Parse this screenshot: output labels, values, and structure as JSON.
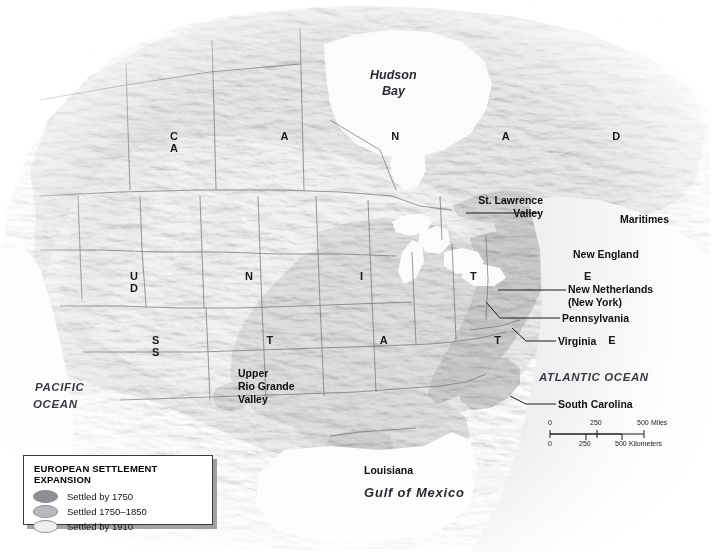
{
  "map": {
    "title": "European Settlement Expansion in North America",
    "countries": [
      {
        "name": "CANADA",
        "letters": "C A N A D A"
      },
      {
        "name": "UNITED STATES",
        "line1": "U N I T E D",
        "line2": "S T A T E S"
      }
    ],
    "water_labels": [
      {
        "name": "hudson-bay",
        "text_line1": "Hudson",
        "text_line2": "Bay"
      },
      {
        "name": "pacific-ocean",
        "text_line1": "PACIFIC",
        "text_line2": "OCEAN"
      },
      {
        "name": "atlantic-ocean",
        "text": "ATLANTIC OCEAN"
      },
      {
        "name": "gulf-of-mexico",
        "text": "Gulf of Mexico"
      }
    ],
    "place_labels": [
      {
        "name": "st-lawrence-valley",
        "line1": "St. Lawrence",
        "line2": "Valley"
      },
      {
        "name": "maritimes",
        "text": "Maritimes"
      },
      {
        "name": "new-england",
        "text": "New England"
      },
      {
        "name": "new-netherlands",
        "line1": "New Netherlands",
        "line2": "(New York)"
      },
      {
        "name": "pennsylvania",
        "text": "Pennsylvania"
      },
      {
        "name": "virginia",
        "text": "Virginia"
      },
      {
        "name": "south-carolina",
        "text": "South Carolina"
      },
      {
        "name": "louisiana",
        "text": "Louisiana"
      },
      {
        "name": "upper-rio-grande-valley",
        "line1": "Upper",
        "line2": "Rio Grande",
        "line3": "Valley"
      }
    ]
  },
  "legend": {
    "title": "EUROPEAN SETTLEMENT EXPANSION",
    "items": [
      {
        "label": "Settled by 1750",
        "color": "#8e8e93"
      },
      {
        "label": "Settled 1750–1850",
        "color": "#b9b9bd"
      },
      {
        "label": "Settled by 1910",
        "color": "#eeeeef"
      }
    ]
  },
  "scale": {
    "miles": {
      "ticks": [
        "0",
        "250",
        "500"
      ],
      "unit": "Miles"
    },
    "kilometers": {
      "ticks": [
        "0",
        "250",
        "500"
      ],
      "unit": "Kilometers"
    }
  },
  "colors": {
    "settled_1750": "#8e8e93",
    "settled_1750_1850": "#b9b9bd",
    "settled_1910": "#eeeeef",
    "land_base": "#d7d7d9",
    "water": "#fbfbfc",
    "border": "#6c6c72"
  }
}
